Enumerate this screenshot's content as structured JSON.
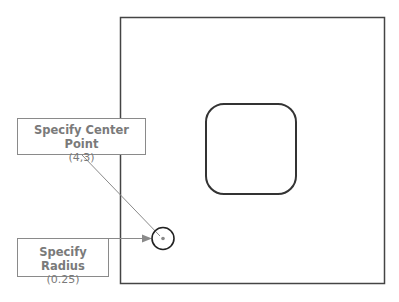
{
  "diagram": {
    "callouts": [
      {
        "title": "Specify Center Point",
        "value": "(4,3)"
      },
      {
        "title": "Specify Radius",
        "value": "(0.25)"
      }
    ],
    "colors": {
      "outline": "#333333",
      "leader": "#8a8a8a",
      "text": "#7a7a7a"
    }
  }
}
